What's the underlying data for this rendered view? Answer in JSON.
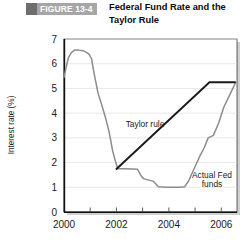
{
  "header": {
    "badge_label": "FIGURE 13-4",
    "title": "Federal Fund Rate and the Taylor Rule",
    "title_line1": "Federal Fund Rate and the",
    "title_line2": "Taylor Rule",
    "badge_block_color": "#6e6e6e",
    "badge_bg_color": "#a6a6a6",
    "badge_text_color": "#ffffff"
  },
  "chart_data": {
    "type": "line",
    "title": "Federal Fund Rate and the Taylor Rule",
    "xlabel": "",
    "ylabel": "Interest rate (%)",
    "xlim": [
      2000,
      2006.6
    ],
    "ylim": [
      0,
      7
    ],
    "grid": true,
    "grid_axis": "y",
    "legend": "annotations",
    "ytick_labels": [
      "0",
      "1",
      "2",
      "3",
      "4",
      "5",
      "6",
      "7"
    ],
    "ytick_values": [
      0,
      1,
      2,
      3,
      4,
      5,
      6,
      7
    ],
    "xtick_labels": [
      "2000",
      "2002",
      "2004",
      "2006"
    ],
    "xtick_values": [
      2000,
      2002,
      2004,
      2006
    ],
    "xminor_values": [
      2001,
      2003,
      2005
    ],
    "series": [
      {
        "name": "Actual Fed funds",
        "color": "#8c8c8c",
        "annotation": "Actual Fed funds",
        "annotation_line1": "Actual Fed",
        "annotation_line2": "funds",
        "x": [
          2000.0,
          2000.08,
          2000.17,
          2000.28,
          2000.4,
          2000.55,
          2000.75,
          2000.95,
          2001.05,
          2001.15,
          2001.3,
          2001.45,
          2001.6,
          2001.72,
          2001.85,
          2001.95,
          2002.05,
          2002.3,
          2002.6,
          2002.8,
          2002.95,
          2003.05,
          2003.2,
          2003.4,
          2003.6,
          2003.9,
          2004.2,
          2004.45,
          2004.6,
          2004.75,
          2004.9,
          2005.05,
          2005.2,
          2005.35,
          2005.5,
          2005.7,
          2005.9,
          2006.1,
          2006.35,
          2006.55
        ],
        "y": [
          5.45,
          5.85,
          6.25,
          6.45,
          6.55,
          6.55,
          6.52,
          6.4,
          6.2,
          5.6,
          4.8,
          4.3,
          3.75,
          3.25,
          2.5,
          2.1,
          1.75,
          1.75,
          1.74,
          1.73,
          1.45,
          1.34,
          1.3,
          1.25,
          1.02,
          1.0,
          1.0,
          1.0,
          1.02,
          1.25,
          1.6,
          1.95,
          2.3,
          2.6,
          3.0,
          3.1,
          3.6,
          4.25,
          4.8,
          5.25
        ]
      },
      {
        "name": "Taylor rule",
        "color": "#1a1a1a",
        "annotation": "Taylor rule",
        "x": [
          2001.98,
          2005.55,
          2006.55
        ],
        "y": [
          1.72,
          5.25,
          5.25
        ]
      }
    ]
  }
}
